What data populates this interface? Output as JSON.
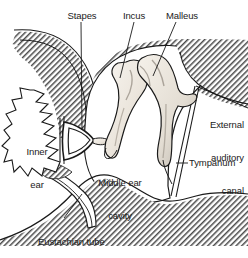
{
  "figure": {
    "background_color": "#ffffff",
    "ink_color": "#1a1a1a",
    "bone_fill_color": "#efeae3",
    "hatch_color": "#3b3b3b",
    "cavity_fill_color": "#ffffff"
  },
  "labels": {
    "stapes": "Stapes",
    "incus": "Incus",
    "malleus": "Malleus",
    "external_auditory_canal_line1": "External",
    "external_auditory_canal_line2": "auditory",
    "external_auditory_canal_line3": "canal",
    "tympanum": "Tympanum",
    "inner_ear_line1": "Inner",
    "inner_ear_line2": "ear",
    "middle_ear_cavity_line1": "Middle ear",
    "middle_ear_cavity_line2": "cavity",
    "eustachian_tube": "Eustachian tube"
  },
  "structures": [
    {
      "name": "stapes",
      "label": "Stapes",
      "kind": "ossicle",
      "description": "Stirrup-shaped bone ring at oval window"
    },
    {
      "name": "incus",
      "label": "Incus",
      "kind": "ossicle",
      "description": "Anvil bone, center of ossicular chain"
    },
    {
      "name": "malleus",
      "label": "Malleus",
      "kind": "ossicle",
      "description": "Hammer bone attached to tympanum"
    },
    {
      "name": "tympanum",
      "label": "Tympanum",
      "kind": "membrane",
      "description": "Eardrum membrane"
    },
    {
      "name": "external-auditory-canal",
      "label": "External auditory canal",
      "kind": "canal",
      "description": "Outer ear canal"
    },
    {
      "name": "inner-ear",
      "label": "Inner ear",
      "kind": "region",
      "description": "Cochlea and vestibular region"
    },
    {
      "name": "middle-ear-cavity",
      "label": "Middle ear cavity",
      "kind": "region",
      "description": "Air-filled tympanic cavity"
    },
    {
      "name": "eustachian-tube",
      "label": "Eustachian tube",
      "kind": "tube",
      "description": "Pharyngotympanic tube to nasopharynx"
    }
  ]
}
